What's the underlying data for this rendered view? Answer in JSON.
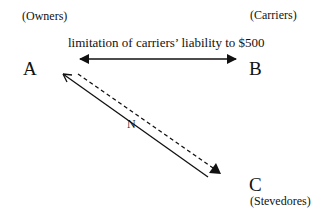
{
  "nodes": {
    "a": {
      "letter": "A",
      "role": "(Owners)"
    },
    "b": {
      "letter": "B",
      "role": "(Carriers)"
    },
    "c": {
      "letter": "C",
      "role": "(Stevedores)"
    }
  },
  "edges": {
    "ab": {
      "label": "limitation of carriers’ liability to $500",
      "style": "solid double-headed"
    },
    "ac_solid": {
      "style": "solid",
      "direction": "C to A",
      "head": "open"
    },
    "ac_dashed": {
      "style": "dashed",
      "direction": "A to C",
      "head": "filled"
    },
    "ac_label": "N"
  }
}
